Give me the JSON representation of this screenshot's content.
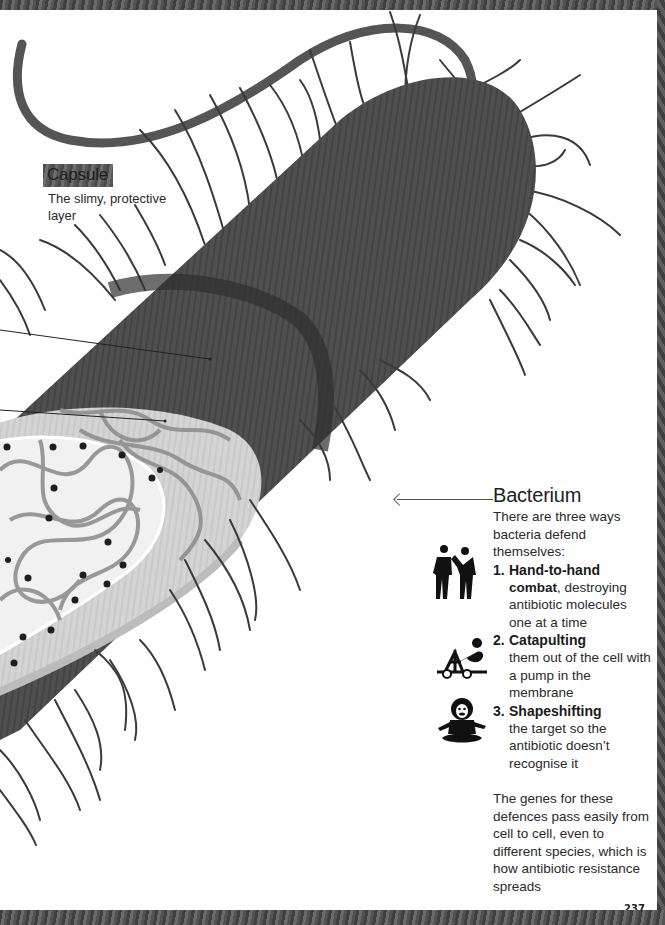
{
  "page": {
    "page_number": "237",
    "colors": {
      "cell_wall": "#4d4d4d",
      "capsule_band": "#2f2f2f",
      "cytoplasm": "#d6d6d6",
      "nucleoid_area": "#f0f0f0",
      "dna_strands": "#8d8d8d",
      "pili": "#3a3a3a",
      "background": "#ffffff",
      "frame": "#4a4a4a"
    }
  },
  "capsule": {
    "title": "Capsule",
    "description": "The slimy, protective layer"
  },
  "bacterium": {
    "title": "Bacterium",
    "intro": "There are three ways bacteria defend themselves:",
    "defences": [
      {
        "number": "1.",
        "head": "Hand-to-hand",
        "body_bold": "combat",
        "body": ", destroying antibiotic molecules one at a time",
        "icon": "fighting-people-icon"
      },
      {
        "number": "2.",
        "head": "Catapulting",
        "body": "them out of the cell with a pump in the membrane",
        "icon": "catapult-icon"
      },
      {
        "number": "3.",
        "head": "Shapeshifting",
        "body": "the target so the antibiotic doesn’t recognise it",
        "icon": "meditating-monkey-icon"
      }
    ],
    "closing": "The genes for these defences pass easily from cell to cell, even to different species, which is how antibiotic resistance spreads"
  }
}
